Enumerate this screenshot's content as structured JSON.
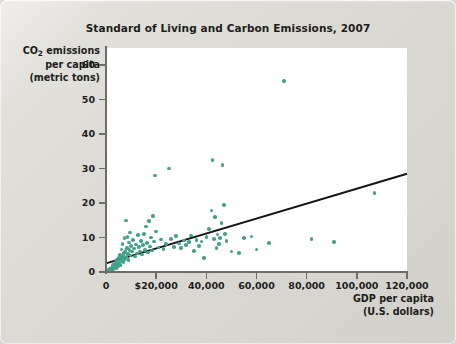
{
  "chart": {
    "title": "Standard of Living and Carbon Emissions, 2007",
    "ylabel_line1": "CO",
    "ylabel_sub": "2",
    "ylabel_line1b": " emissions",
    "ylabel_line2": "per capita",
    "ylabel_line3": "(metric tons)",
    "xlabel_line1": "GDP per capita",
    "xlabel_line2": "(U.S. dollars)",
    "dot_color": "#44a189",
    "trend_color": "#141414",
    "axis_color": "#6e6c68",
    "plot_background": "#ffffff",
    "figure_background": "#dcdad5"
  },
  "chart_data": {
    "type": "scatter",
    "title": "Standard of Living and Carbon Emissions, 2007",
    "xlabel": "GDP per capita (U.S. dollars)",
    "ylabel": "CO2 emissions per capita (metric tons)",
    "xlim": [
      0,
      120000
    ],
    "ylim": [
      0,
      65
    ],
    "xticks": [
      0,
      20000,
      40000,
      60000,
      80000,
      100000,
      120000
    ],
    "xtick_labels": [
      "0",
      "$20,000",
      "40,000",
      "60,000",
      "80,000",
      "100,000",
      "120,000"
    ],
    "yticks": [
      0,
      10,
      20,
      30,
      40,
      50,
      60
    ],
    "ytick_labels": [
      "0",
      "10",
      "20",
      "30",
      "40",
      "50",
      "60"
    ],
    "grid": false,
    "legend": false,
    "series": [
      {
        "name": "Countries",
        "marker": "circle",
        "color": "#44a189",
        "points": [
          [
            600,
            0.3
          ],
          [
            900,
            0.4
          ],
          [
            1100,
            0.5
          ],
          [
            1300,
            0.6
          ],
          [
            1500,
            0.2
          ],
          [
            1700,
            0.8
          ],
          [
            1900,
            1.0
          ],
          [
            2100,
            0.5
          ],
          [
            2300,
            1.3
          ],
          [
            2500,
            0.9
          ],
          [
            2700,
            1.6
          ],
          [
            2900,
            2.0
          ],
          [
            3000,
            0.7
          ],
          [
            3200,
            1.1
          ],
          [
            3400,
            2.4
          ],
          [
            3600,
            1.5
          ],
          [
            3800,
            3.0
          ],
          [
            4000,
            2.2
          ],
          [
            4200,
            1.2
          ],
          [
            4400,
            3.6
          ],
          [
            4600,
            2.8
          ],
          [
            4800,
            1.8
          ],
          [
            5000,
            4.2
          ],
          [
            5200,
            2.5
          ],
          [
            5400,
            3.3
          ],
          [
            5600,
            5.0
          ],
          [
            5800,
            2.1
          ],
          [
            6000,
            4.0
          ],
          [
            6200,
            6.5
          ],
          [
            6400,
            3.1
          ],
          [
            6600,
            8.2
          ],
          [
            6800,
            4.6
          ],
          [
            7000,
            2.9
          ],
          [
            7200,
            5.5
          ],
          [
            7400,
            9.8
          ],
          [
            7600,
            3.8
          ],
          [
            7800,
            6.1
          ],
          [
            8000,
            15.0
          ],
          [
            8200,
            4.3
          ],
          [
            8400,
            7.0
          ],
          [
            8600,
            10.2
          ],
          [
            8800,
            5.2
          ],
          [
            9000,
            3.5
          ],
          [
            9200,
            8.6
          ],
          [
            9400,
            6.3
          ],
          [
            9600,
            11.5
          ],
          [
            9800,
            4.8
          ],
          [
            10000,
            7.6
          ],
          [
            10400,
            5.9
          ],
          [
            10800,
            9.2
          ],
          [
            11200,
            6.8
          ],
          [
            11600,
            4.5
          ],
          [
            12000,
            8.0
          ],
          [
            12400,
            5.4
          ],
          [
            12800,
            10.8
          ],
          [
            13200,
            7.2
          ],
          [
            13600,
            6.0
          ],
          [
            14000,
            9.0
          ],
          [
            14400,
            5.1
          ],
          [
            14800,
            7.9
          ],
          [
            15200,
            11.0
          ],
          [
            15600,
            6.4
          ],
          [
            16000,
            13.2
          ],
          [
            16400,
            8.4
          ],
          [
            16800,
            5.7
          ],
          [
            17200,
            14.8
          ],
          [
            17600,
            7.4
          ],
          [
            18000,
            10.0
          ],
          [
            18400,
            6.2
          ],
          [
            18800,
            16.2
          ],
          [
            19200,
            8.8
          ],
          [
            19600,
            28.0
          ],
          [
            20000,
            11.8
          ],
          [
            21000,
            7.1
          ],
          [
            22000,
            9.4
          ],
          [
            23000,
            6.6
          ],
          [
            24000,
            8.1
          ],
          [
            25000,
            30.0
          ],
          [
            26000,
            9.6
          ],
          [
            27000,
            7.3
          ],
          [
            28000,
            10.4
          ],
          [
            29000,
            8.3
          ],
          [
            30000,
            6.9
          ],
          [
            31000,
            9.1
          ],
          [
            32000,
            7.8
          ],
          [
            33000,
            8.7
          ],
          [
            34000,
            10.6
          ],
          [
            35000,
            6.1
          ],
          [
            36000,
            9.3
          ],
          [
            37000,
            7.5
          ],
          [
            38000,
            8.9
          ],
          [
            39000,
            4.0
          ],
          [
            40000,
            10.1
          ],
          [
            41000,
            12.4
          ],
          [
            42000,
            17.8
          ],
          [
            42500,
            32.5
          ],
          [
            43000,
            9.5
          ],
          [
            43500,
            16.0
          ],
          [
            44000,
            7.0
          ],
          [
            44500,
            10.9
          ],
          [
            45000,
            8.2
          ],
          [
            45500,
            9.9
          ],
          [
            46000,
            14.2
          ],
          [
            46500,
            31.0
          ],
          [
            47000,
            19.5
          ],
          [
            47500,
            11.0
          ],
          [
            48000,
            9.0
          ],
          [
            50000,
            6.0
          ],
          [
            53000,
            5.5
          ],
          [
            55000,
            9.8
          ],
          [
            58000,
            10.3
          ],
          [
            60000,
            6.5
          ],
          [
            65000,
            8.5
          ],
          [
            71000,
            55.5
          ],
          [
            82000,
            9.5
          ],
          [
            91000,
            8.7
          ],
          [
            107000,
            23.0
          ]
        ]
      }
    ],
    "trendline": {
      "type": "linear",
      "x_start": 0,
      "y_start": 2.5,
      "x_end": 120000,
      "y_end": 28.5,
      "color": "#141414"
    }
  }
}
